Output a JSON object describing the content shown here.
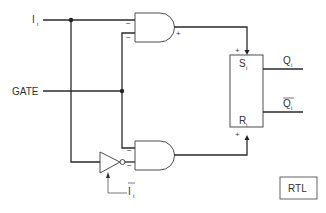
{
  "diagram": {
    "inputs": {
      "data": {
        "name": "I",
        "subscript": "i"
      },
      "gate": {
        "name": "GATE"
      }
    },
    "inverter_output": {
      "name": "I",
      "subscript": "i",
      "overbar": true
    },
    "and_gate_top": {
      "input_signs": [
        "−",
        "−"
      ],
      "output_sign": "+"
    },
    "and_gate_bottom": {
      "input_signs": [
        "−",
        "−"
      ],
      "output_sign": "+"
    },
    "flip_flop": {
      "set": {
        "name": "S",
        "subscript": "i",
        "input_sign": "+"
      },
      "reset": {
        "name": "R",
        "subscript": "i",
        "input_sign": "+"
      },
      "outputs": [
        {
          "name": "Q",
          "subscript": "i",
          "overbar": false
        },
        {
          "name": "Q",
          "subscript": "i",
          "overbar": true
        }
      ]
    },
    "logic_family_label": "RTL"
  }
}
